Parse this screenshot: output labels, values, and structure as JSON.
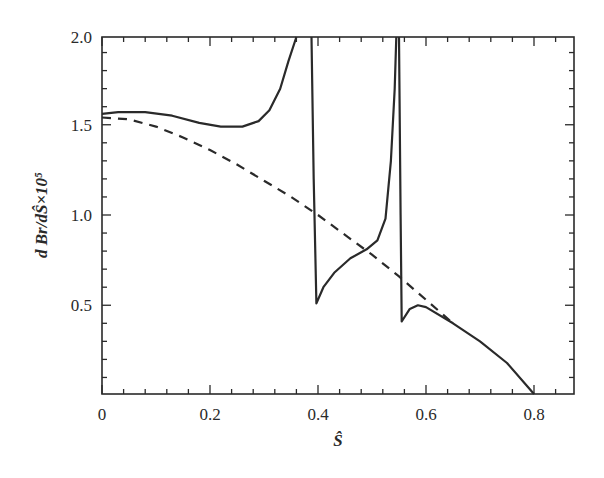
{
  "chart_data": {
    "type": "line",
    "title": "",
    "xlabel": "Ŝ",
    "ylabel": "d Br/dŜ×10⁵",
    "xlim": [
      0,
      0.874
    ],
    "ylim": [
      0,
      2.0
    ],
    "x_ticks": [
      "0",
      "0.2",
      "0.4",
      "0.6",
      "0.8"
    ],
    "y_ticks": [
      "0.5",
      "1.0",
      "1.5",
      "2.0"
    ],
    "grid": false,
    "legend": null,
    "series": [
      {
        "name": "solid (with resonances)",
        "style": "solid",
        "points": [
          [
            0.0,
            1.56
          ],
          [
            0.03,
            1.57
          ],
          [
            0.08,
            1.57
          ],
          [
            0.13,
            1.55
          ],
          [
            0.18,
            1.51
          ],
          [
            0.22,
            1.49
          ],
          [
            0.26,
            1.49
          ],
          [
            0.29,
            1.52
          ],
          [
            0.31,
            1.58
          ],
          [
            0.33,
            1.7
          ],
          [
            0.345,
            1.85
          ],
          [
            0.36,
            2.0
          ]
        ]
      },
      {
        "name": "solid (segment 2)",
        "style": "solid",
        "points": [
          [
            0.388,
            2.0
          ],
          [
            0.392,
            1.2
          ],
          [
            0.397,
            0.51
          ],
          [
            0.41,
            0.6
          ],
          [
            0.43,
            0.68
          ],
          [
            0.46,
            0.76
          ],
          [
            0.49,
            0.81
          ],
          [
            0.51,
            0.86
          ],
          [
            0.525,
            0.98
          ],
          [
            0.535,
            1.3
          ],
          [
            0.542,
            1.7
          ],
          [
            0.545,
            2.0
          ]
        ]
      },
      {
        "name": "solid (segment 3)",
        "style": "solid",
        "points": [
          [
            0.55,
            2.0
          ],
          [
            0.553,
            1.0
          ],
          [
            0.555,
            0.41
          ],
          [
            0.57,
            0.48
          ],
          [
            0.585,
            0.5
          ],
          [
            0.6,
            0.49
          ],
          [
            0.65,
            0.4
          ],
          [
            0.7,
            0.3
          ],
          [
            0.75,
            0.18
          ],
          [
            0.8,
            0.0
          ]
        ]
      },
      {
        "name": "dashed",
        "style": "dashed",
        "points": [
          [
            0.0,
            1.54
          ],
          [
            0.05,
            1.53
          ],
          [
            0.1,
            1.49
          ],
          [
            0.15,
            1.43
          ],
          [
            0.2,
            1.36
          ],
          [
            0.25,
            1.28
          ],
          [
            0.3,
            1.19
          ],
          [
            0.35,
            1.1
          ],
          [
            0.4,
            1.0
          ],
          [
            0.45,
            0.89
          ],
          [
            0.5,
            0.78
          ],
          [
            0.55,
            0.66
          ],
          [
            0.6,
            0.53
          ],
          [
            0.65,
            0.4
          ]
        ]
      }
    ]
  }
}
